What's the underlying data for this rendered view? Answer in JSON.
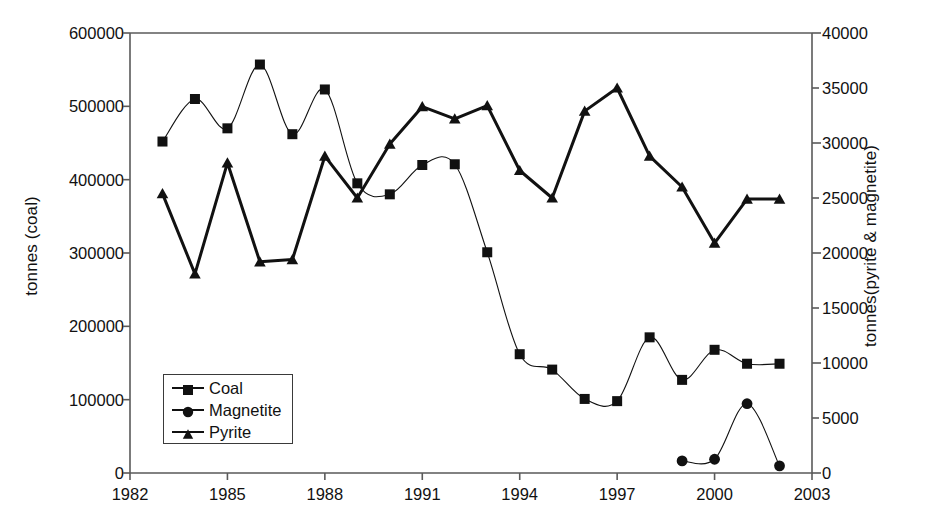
{
  "chart_data": {
    "type": "line",
    "title": "",
    "xlabel": "",
    "ylabel": "tonnes (coal)",
    "y2label": "tonnes(pyrite & magnetite)",
    "xlim": [
      1982,
      2003
    ],
    "xticks": [
      1982,
      1985,
      1988,
      1991,
      1994,
      1997,
      2000,
      2003
    ],
    "xtick_labels": [
      "1982",
      "1985",
      "1988",
      "1991",
      "1994",
      "1997",
      "2000",
      "2003"
    ],
    "ylim": [
      0,
      600000
    ],
    "yticks": [
      0,
      100000,
      200000,
      300000,
      400000,
      500000,
      600000
    ],
    "ytick_labels": [
      "0",
      "100000",
      "200000",
      "300000",
      "400000",
      "500000",
      "600000"
    ],
    "y2lim": [
      0,
      40000
    ],
    "y2ticks": [
      0,
      5000,
      10000,
      15000,
      20000,
      25000,
      30000,
      35000,
      40000
    ],
    "y2tick_labels": [
      "0",
      "5000",
      "10000",
      "15000",
      "20000",
      "25000",
      "30000",
      "35000",
      "40000"
    ],
    "grid": false,
    "legend_position": "lower-left-inside",
    "series": [
      {
        "name": "Coal",
        "axis": "left",
        "marker": "square",
        "x": [
          1983,
          1984,
          1985,
          1986,
          1987,
          1988,
          1989,
          1990,
          1991,
          1992,
          1993,
          1994,
          1995,
          1996,
          1997,
          1998,
          1999,
          2000,
          2001,
          2002
        ],
        "values": [
          452000,
          510000,
          470000,
          557000,
          462000,
          523000,
          395000,
          380000,
          420000,
          421000,
          301000,
          162000,
          141000,
          101000,
          98000,
          185000,
          127000,
          168000,
          149000,
          149000
        ]
      },
      {
        "name": "Magnetite",
        "axis": "right",
        "marker": "circle",
        "x": [
          1999,
          2000,
          2001,
          2002
        ],
        "values": [
          1100,
          1250,
          6300,
          650
        ]
      },
      {
        "name": "Pyrite",
        "axis": "right",
        "marker": "triangle",
        "x": [
          1983,
          1984,
          1985,
          1986,
          1987,
          1988,
          1989,
          1990,
          1991,
          1992,
          1993,
          1994,
          1995,
          1996,
          1997,
          1998,
          1999,
          2000,
          2001,
          2002
        ],
        "values": [
          25400,
          18100,
          28200,
          19200,
          19400,
          28800,
          25000,
          29900,
          33300,
          32200,
          33400,
          27500,
          25000,
          32900,
          35000,
          28800,
          26000,
          20900,
          24900,
          24900
        ]
      }
    ]
  },
  "legend": {
    "items": [
      {
        "label": "Coal",
        "marker": "square"
      },
      {
        "label": "Magnetite",
        "marker": "circle"
      },
      {
        "label": "Pyrite",
        "marker": "triangle"
      }
    ]
  }
}
